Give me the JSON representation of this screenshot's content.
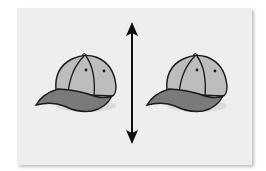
{
  "figure": {
    "description": "Two identical baseball caps separated by a vertical double-headed arrow",
    "colors": {
      "background": "#ffffff",
      "panel": "#eeeeee",
      "cap_crown": "#bdbdbd",
      "cap_brim": "#7a7a7a",
      "outline": "#1a1a1a",
      "arrow": "#111111"
    },
    "objects": [
      {
        "name": "cap-left",
        "type": "baseball-cap"
      },
      {
        "name": "double-arrow",
        "type": "vertical-double-headed-arrow"
      },
      {
        "name": "cap-right",
        "type": "baseball-cap"
      }
    ]
  }
}
